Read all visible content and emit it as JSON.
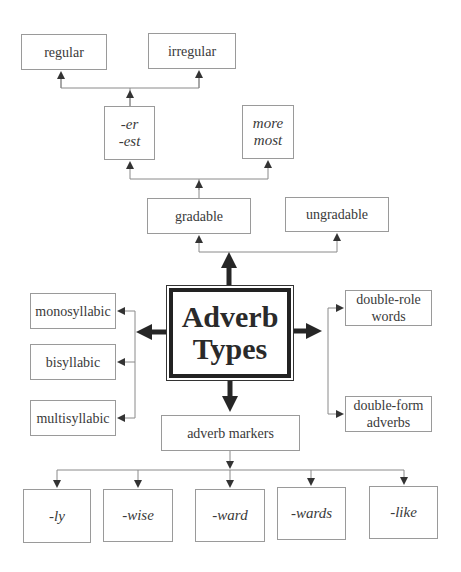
{
  "diagram": {
    "center": {
      "line1": "Adverb",
      "line2": "Types"
    },
    "top": {
      "gradable": "gradable",
      "ungradable": "ungradable",
      "er_est": {
        "line1": "-er",
        "line2": "-est"
      },
      "more_most": {
        "line1": "more",
        "line2": "most"
      },
      "regular": "regular",
      "irregular": "irregular"
    },
    "left": [
      {
        "label": "monosyllabic"
      },
      {
        "label": "bisyllabic"
      },
      {
        "label": "multisyllabic"
      }
    ],
    "right": [
      {
        "line1": "double-role",
        "line2": "words"
      },
      {
        "line1": "double-form",
        "line2": "adverbs"
      }
    ],
    "bottom": {
      "markers": "adverb markers",
      "suffixes": [
        "-ly",
        "-wise",
        "-ward",
        "-wards",
        "-like"
      ]
    },
    "colors": {
      "thin_line": "#8a8a8a",
      "thick_arrow": "#262626",
      "box_border": "#9a9a9a"
    }
  }
}
